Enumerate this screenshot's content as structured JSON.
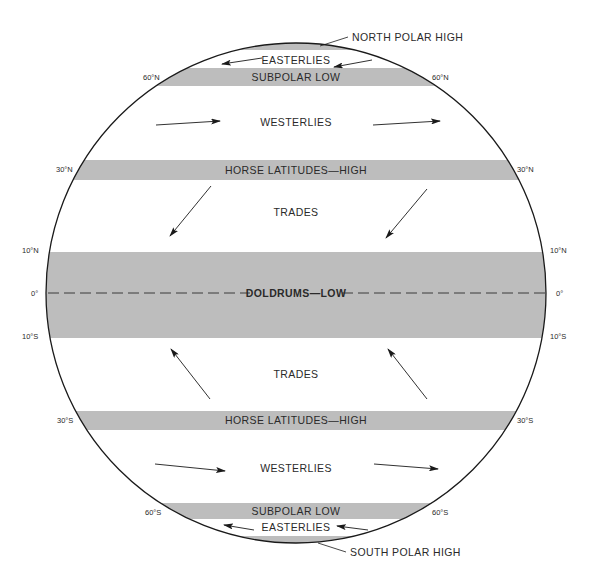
{
  "diagram": {
    "colors": {
      "band_fill": "#bdbdbd",
      "outline": "#1a1a1a",
      "text": "#2a2a2a",
      "background": "#ffffff"
    },
    "globe": {
      "cx": 296,
      "cy": 293,
      "r": 250
    },
    "callouts": {
      "north_polar_high": "NORTH POLAR HIGH",
      "south_polar_high": "SOUTH POLAR HIGH"
    },
    "belts": [
      {
        "id": "north-polar-cap",
        "label": "",
        "y0": 43,
        "y1": 50
      },
      {
        "id": "subpolar-low-n",
        "label": "SUBPOLAR LOW",
        "y0": 68,
        "y1": 86
      },
      {
        "id": "horse-latitudes-n",
        "label": "HORSE LATITUDES—HIGH",
        "y0": 160,
        "y1": 180
      },
      {
        "id": "doldrums",
        "label": "DOLDRUMS—LOW",
        "y0": 252,
        "y1": 338
      },
      {
        "id": "horse-latitudes-s",
        "label": "HORSE LATITUDES—HIGH",
        "y0": 411,
        "y1": 430
      },
      {
        "id": "subpolar-low-s",
        "label": "SUBPOLAR LOW",
        "y0": 503,
        "y1": 519
      },
      {
        "id": "south-polar-cap",
        "label": "",
        "y0": 536,
        "y1": 543
      }
    ],
    "wind_zones": {
      "easterlies_n": "EASTERLIES",
      "westerlies_n": "WESTERLIES",
      "trades_n": "TRADES",
      "trades_s": "TRADES",
      "westerlies_s": "WESTERLIES",
      "easterlies_s": "EASTERLIES"
    },
    "latitudes": {
      "n60": "60°N",
      "n30": "30°N",
      "n10": "10°N",
      "eq": "0°",
      "s10": "10°S",
      "s30": "30°S",
      "s60": "60°S"
    },
    "arrows": [
      {
        "name": "easterlies-n-left",
        "x1": 262,
        "y1": 58,
        "x2": 222,
        "y2": 64
      },
      {
        "name": "easterlies-n-right",
        "x1": 372,
        "y1": 60,
        "x2": 334,
        "y2": 67
      },
      {
        "name": "westerlies-n-left",
        "x1": 156,
        "y1": 125,
        "x2": 220,
        "y2": 121
      },
      {
        "name": "westerlies-n-right",
        "x1": 373,
        "y1": 125,
        "x2": 440,
        "y2": 121
      },
      {
        "name": "trades-ne-left",
        "x1": 211,
        "y1": 186,
        "x2": 170,
        "y2": 236
      },
      {
        "name": "trades-ne-right",
        "x1": 427,
        "y1": 189,
        "x2": 386,
        "y2": 238
      },
      {
        "name": "trades-se-left",
        "x1": 210,
        "y1": 399,
        "x2": 171,
        "y2": 349
      },
      {
        "name": "trades-se-right",
        "x1": 427,
        "y1": 399,
        "x2": 388,
        "y2": 349
      },
      {
        "name": "westerlies-s-left",
        "x1": 155,
        "y1": 464,
        "x2": 225,
        "y2": 471
      },
      {
        "name": "westerlies-s-right",
        "x1": 374,
        "y1": 464,
        "x2": 438,
        "y2": 469
      },
      {
        "name": "easterlies-s-left",
        "x1": 254,
        "y1": 530,
        "x2": 224,
        "y2": 525
      },
      {
        "name": "easterlies-s-right",
        "x1": 368,
        "y1": 530,
        "x2": 337,
        "y2": 526
      }
    ]
  }
}
